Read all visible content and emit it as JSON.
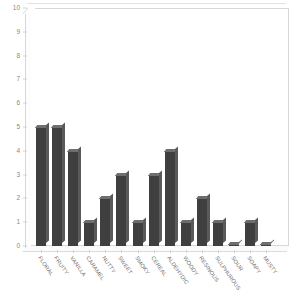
{
  "chart": {
    "title": "",
    "y_axis": {
      "label": "",
      "min": 0,
      "max": 10,
      "ticks": [
        "0",
        "1",
        "2",
        "3",
        "4",
        "5",
        "6",
        "7",
        "8",
        "9",
        "10"
      ]
    },
    "x_axis": {
      "label": ""
    }
  },
  "chart_data": {
    "type": "bar",
    "title": "",
    "xlabel": "",
    "ylabel": "",
    "ylim": [
      0,
      10
    ],
    "grid": false,
    "legend": false,
    "style": "3d-column",
    "bar_color": "#3f3f3f",
    "categories": [
      "FLORAL",
      "FRUITY",
      "VANILLA",
      "CARAMEL",
      "NUTTY",
      "SWEET",
      "SMOKY",
      "CEREAL",
      "ALDEHYDIC",
      "WOODY",
      "RESINOUS",
      "SULPHUROUS",
      "SOUR",
      "SOAPY",
      "MUSTY"
    ],
    "values": [
      5,
      5,
      4,
      1,
      2,
      3,
      1,
      3,
      4,
      1,
      2,
      1,
      0,
      1,
      0
    ],
    "ytick_values": [
      0,
      1,
      2,
      3,
      4,
      5,
      6,
      7,
      8,
      9,
      10
    ]
  }
}
